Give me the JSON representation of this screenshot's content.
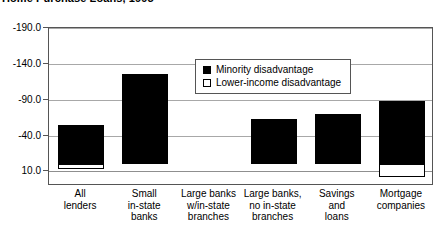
{
  "title": "Home Purchase Loans, 1995",
  "legend": {
    "position": "inside-top-center",
    "items": [
      {
        "label": "Minority disadvantage",
        "swatch": "filled-square",
        "color": "#000000"
      },
      {
        "label": "Lower-income disadvantage",
        "swatch": "hollow-square",
        "color": "#FFFFFF"
      }
    ]
  },
  "yaxis": {
    "ticks": [
      "-190.0",
      "-140.0",
      "-90.0",
      "-40.0",
      "10.0"
    ],
    "values": [
      -190,
      -140,
      -90,
      -40,
      10
    ]
  },
  "xaxis": {
    "categories": [
      [
        "All",
        "lenders"
      ],
      [
        "Small",
        "in-state",
        "banks"
      ],
      [
        "Large banks",
        "w/in-state",
        "branches"
      ],
      [
        "Large banks,",
        "no in-state",
        "branches"
      ],
      [
        "Savings",
        "and",
        "loans"
      ],
      [
        "Mortgage",
        "companies"
      ]
    ]
  },
  "chart_data": {
    "type": "bar",
    "title": "Home Purchase Loans, 1995",
    "xlabel": "",
    "ylabel": "",
    "ylim": [
      -190,
      25
    ],
    "yticks": [
      -190,
      -140,
      -90,
      -40,
      10
    ],
    "y_axis_inverted": true,
    "grid": true,
    "legend": [
      "Minority disadvantage",
      "Lower-income disadvantage"
    ],
    "legend_position": "inside-top-center",
    "categories": [
      "All lenders",
      "Small in-state banks",
      "Large banks w/in-state branches",
      "Large banks, no in-state branches",
      "Savings and loans",
      "Mortgage companies"
    ],
    "series": [
      {
        "name": "Minority disadvantage",
        "color": "#000000",
        "values": [
          -55,
          -125,
          0,
          -63,
          -70,
          -88
        ]
      },
      {
        "name": "Lower-income disadvantage",
        "color": "#FFFFFF",
        "values": [
          4,
          0,
          0,
          0,
          0,
          18
        ]
      }
    ]
  }
}
